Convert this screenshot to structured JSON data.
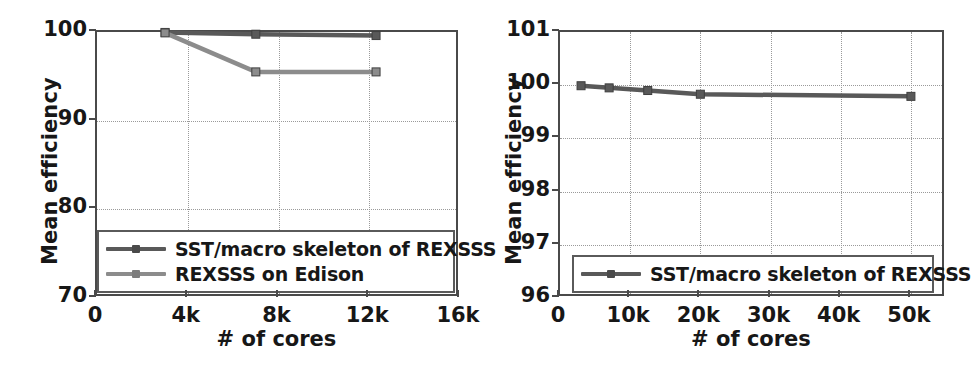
{
  "figure": {
    "background": "#ffffff",
    "colors": {
      "series_dark": "#595959",
      "series_light": "#8c8c8c",
      "axis": "#4a4a4a",
      "grid": "#9a9a9a",
      "text": "#171717"
    }
  },
  "chart_data": [
    {
      "id": "left",
      "type": "line",
      "title": "",
      "xlabel": "# of cores",
      "ylabel": "Mean efficiency",
      "xlim": [
        0,
        16000
      ],
      "ylim": [
        70,
        100
      ],
      "xticks": [
        0,
        4000,
        8000,
        12000,
        16000
      ],
      "xticklabels": [
        "0",
        "4k",
        "8k",
        "12k",
        "16k"
      ],
      "yticks": [
        70,
        80,
        90,
        100
      ],
      "yticklabels": [
        "70",
        "80",
        "90",
        "100"
      ],
      "grid": true,
      "legend_position": "lower center",
      "series": [
        {
          "name": "SST/macro skeleton of REXSSS",
          "color": "#595959",
          "marker": "square",
          "x": [
            3000,
            7000,
            12300
          ],
          "values": [
            99.95,
            99.75,
            99.6
          ]
        },
        {
          "name": "REXSSS on Edison",
          "color": "#8c8c8c",
          "marker": "square",
          "x": [
            3000,
            7000,
            12300
          ],
          "values": [
            99.9,
            95.5,
            95.5
          ]
        }
      ]
    },
    {
      "id": "right",
      "type": "line",
      "title": "",
      "xlabel": "# of cores",
      "ylabel": "Mean efficiency",
      "xlim": [
        0,
        55000
      ],
      "ylim": [
        96,
        101
      ],
      "xticks": [
        0,
        10000,
        20000,
        30000,
        40000,
        50000
      ],
      "xticklabels": [
        "0",
        "10k",
        "20k",
        "30k",
        "40k",
        "50k"
      ],
      "yticks": [
        96,
        97,
        98,
        99,
        100,
        101
      ],
      "yticklabels": [
        "96",
        "97",
        "98",
        "99",
        "100",
        "101"
      ],
      "grid": true,
      "legend_position": "lower center",
      "series": [
        {
          "name": "SST/macro skeleton of REXSSS",
          "color": "#595959",
          "marker": "square",
          "x": [
            3000,
            7000,
            12500,
            20000,
            50000
          ],
          "values": [
            99.99,
            99.95,
            99.9,
            99.83,
            99.79
          ]
        }
      ]
    }
  ]
}
